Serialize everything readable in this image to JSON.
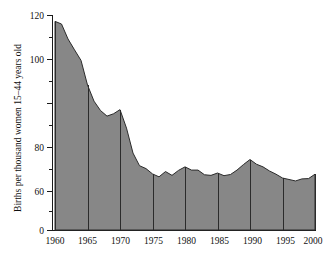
{
  "chart_data": {
    "type": "area",
    "title": "",
    "xlabel": "",
    "ylabel": "Births per thousand women 15–44 years old",
    "xlim": [
      1960,
      2000
    ],
    "ylim": [
      0,
      120
    ],
    "grid": false,
    "legend": false,
    "y_axis_break_below": 60,
    "y_ticks_major": [
      0,
      60,
      80,
      100,
      120
    ],
    "y_ticks_major_labels": [
      "0",
      "60",
      "80",
      "100",
      "120"
    ],
    "y_ticks_minor": [
      70,
      90,
      110
    ],
    "x_ticks_major": [
      1960,
      1965,
      1970,
      1975,
      1980,
      1985,
      1990,
      1995,
      2000
    ],
    "x_ticks_major_labels": [
      "1960",
      "1965",
      "1970",
      "1975",
      "1980",
      "1985",
      "1990",
      "1995",
      "2000"
    ],
    "x": [
      1960,
      1961,
      1962,
      1963,
      1964,
      1965,
      1966,
      1967,
      1968,
      1969,
      1970,
      1971,
      1972,
      1973,
      1974,
      1975,
      1976,
      1977,
      1978,
      1979,
      1980,
      1981,
      1982,
      1983,
      1984,
      1985,
      1986,
      1987,
      1988,
      1989,
      1990,
      1991,
      1992,
      1993,
      1994,
      1995,
      1996,
      1997,
      1998,
      1999,
      2000
    ],
    "values": [
      118.0,
      117.1,
      112.0,
      108.3,
      104.7,
      96.3,
      90.8,
      87.6,
      85.7,
      86.5,
      87.9,
      81.6,
      73.1,
      68.8,
      67.8,
      66.0,
      65.0,
      66.8,
      65.5,
      67.2,
      68.4,
      67.3,
      67.3,
      65.7,
      65.5,
      66.3,
      65.4,
      65.8,
      67.3,
      69.2,
      70.9,
      69.3,
      68.4,
      67.0,
      65.9,
      64.6,
      64.1,
      63.6,
      64.3,
      64.4,
      65.9
    ],
    "series": [
      {
        "name": "Birth rate",
        "values": [
          118.0,
          117.1,
          112.0,
          108.3,
          104.7,
          96.3,
          90.8,
          87.6,
          85.7,
          86.5,
          87.9,
          81.6,
          73.1,
          68.8,
          67.8,
          66.0,
          65.0,
          66.8,
          65.5,
          67.2,
          68.4,
          67.3,
          67.3,
          65.7,
          65.5,
          66.3,
          65.4,
          65.8,
          67.3,
          69.2,
          70.9,
          69.3,
          68.4,
          67.0,
          65.9,
          64.6,
          64.1,
          63.6,
          64.3,
          64.4,
          65.9
        ]
      }
    ],
    "colors": {
      "area_fill": "#878787",
      "area_stroke": "#2b2b2b",
      "axis": "#1a1a1a",
      "text": "#101010",
      "frame": "#b9b9b9",
      "background": "#ffffff"
    }
  }
}
